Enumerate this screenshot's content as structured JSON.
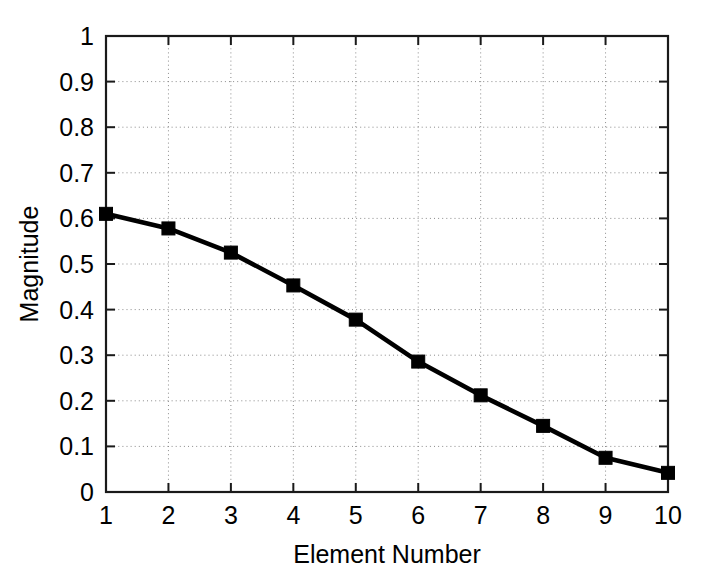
{
  "chart_data": {
    "type": "line",
    "title": "",
    "xlabel": "Element Number",
    "ylabel": "Magnitude",
    "x": [
      1,
      2,
      3,
      4,
      5,
      6,
      7,
      8,
      9,
      10
    ],
    "values": [
      0.61,
      0.578,
      0.525,
      0.453,
      0.378,
      0.286,
      0.212,
      0.145,
      0.075,
      0.042
    ],
    "series": [
      {
        "name": "Magnitude",
        "values": [
          0.61,
          0.578,
          0.525,
          0.453,
          0.378,
          0.286,
          0.212,
          0.145,
          0.075,
          0.042
        ]
      }
    ],
    "xlim": [
      1,
      10
    ],
    "ylim": [
      0,
      1
    ],
    "xticks": [
      1,
      2,
      3,
      4,
      5,
      6,
      7,
      8,
      9,
      10
    ],
    "yticks": [
      0,
      0.1,
      0.2,
      0.3,
      0.4,
      0.5,
      0.6,
      0.7,
      0.8,
      0.9,
      1
    ],
    "xtick_labels": [
      "1",
      "2",
      "3",
      "4",
      "5",
      "6",
      "7",
      "8",
      "9",
      "10"
    ],
    "ytick_labels": [
      "0",
      "0.1",
      "0.2",
      "0.3",
      "0.4",
      "0.5",
      "0.6",
      "0.7",
      "0.8",
      "0.9",
      "1"
    ],
    "grid": true,
    "grid_style": "dotted",
    "legend": null,
    "marker": "square",
    "line_color": "#000000",
    "marker_color": "#000000",
    "background_color": "#ffffff"
  }
}
